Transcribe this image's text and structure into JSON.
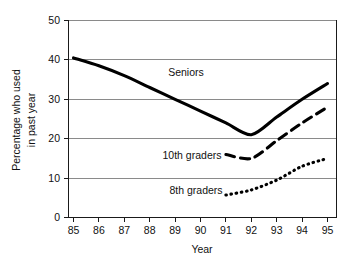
{
  "chart_data": {
    "type": "line",
    "title": "",
    "xlabel": "Year",
    "ylabel": "Percentage who used in past year",
    "ylabel_line1": "Percentage who used",
    "ylabel_line2": "in past year",
    "x": [
      85,
      86,
      87,
      88,
      89,
      90,
      91,
      92,
      93,
      94,
      95
    ],
    "xtick_labels": [
      "85",
      "86",
      "87",
      "88",
      "89",
      "90",
      "91",
      "92",
      "93",
      "94",
      "95"
    ],
    "ytick_labels": [
      "0",
      "10",
      "20",
      "30",
      "40",
      "50"
    ],
    "yticks": [
      0,
      10,
      20,
      30,
      40,
      50
    ],
    "ylim": [
      0,
      50
    ],
    "xlim": [
      84.6,
      95.4
    ],
    "grid": "horizontal",
    "legend": "inline-annotations",
    "series": [
      {
        "name": "Seniors",
        "style": "solid",
        "color": "#000000",
        "x": [
          85,
          86,
          87,
          88,
          89,
          90,
          91,
          92,
          93,
          94,
          95
        ],
        "values": [
          40.5,
          38.5,
          36.0,
          33.0,
          30.0,
          27.0,
          24.0,
          21.0,
          25.5,
          30.0,
          34.0
        ],
        "label_x": 89.2,
        "label_y": 35.5
      },
      {
        "name": "10th graders",
        "style": "dashed",
        "color": "#000000",
        "x": [
          91,
          92,
          93,
          94,
          95
        ],
        "values": [
          16.0,
          15.0,
          19.5,
          24.0,
          28.0
        ],
        "label_x": 88.3,
        "label_y": 15.8
      },
      {
        "name": "8th graders",
        "style": "dotted",
        "color": "#000000",
        "x": [
          91,
          92,
          93,
          94,
          95
        ],
        "values": [
          5.7,
          7.0,
          9.5,
          13.0,
          15.0
        ],
        "label_x": 88.6,
        "label_y": 6.9
      }
    ]
  },
  "axes": {
    "y_label_line1": "Percentage who used",
    "y_label_line2": "in past year",
    "x_label": "Year"
  },
  "annotations": {
    "seniors": "Seniors",
    "tenth_graders": "10th graders",
    "eighth_graders": "8th graders"
  },
  "ticks": {
    "y": [
      "50",
      "40",
      "30",
      "20",
      "10",
      "0"
    ],
    "x": [
      "85",
      "86",
      "87",
      "88",
      "89",
      "90",
      "91",
      "92",
      "93",
      "94",
      "95"
    ]
  },
  "colors": {
    "line": "#000000",
    "grid": "#8a8a8a",
    "axis": "#1a1a1a",
    "text": "#111111",
    "background": "#ffffff"
  }
}
